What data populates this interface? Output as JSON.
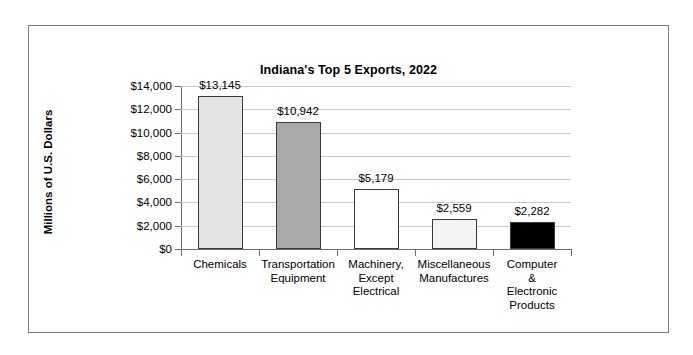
{
  "chart_data": {
    "type": "bar",
    "title": "Indiana's Top 5 Exports, 2022",
    "xlabel": "",
    "ylabel": "Millions of U.S. Dollars",
    "categories": [
      "Chemicals",
      "Transportation\nEquipment",
      "Machinery,\nExcept\nElectrical",
      "Miscellaneous\nManufactures",
      "Computer &\nElectronic\nProducts"
    ],
    "values": [
      13145,
      10942,
      5179,
      2559,
      2282
    ],
    "value_labels": [
      "$13,145",
      "$10,942",
      "$5,179",
      "$2,559",
      "$2,282"
    ],
    "bar_colors": [
      "#e4e4e4",
      "#a9a9a9",
      "#ffffff",
      "#f4f4f4",
      "#000000"
    ],
    "bar_edge_color": "#3a3a3a",
    "ylim": [
      0,
      14000
    ],
    "ytick_values": [
      0,
      2000,
      4000,
      6000,
      8000,
      10000,
      12000,
      14000
    ],
    "ytick_labels": [
      "$0",
      "$2,000",
      "$4,000",
      "$6,000",
      "$8,000",
      "$10,000",
      "$12,000",
      "$14,000"
    ],
    "grid": "horizontal",
    "gridline_color": "#c9c9c9",
    "axis_color": "#6e6e6e",
    "legend": "none",
    "border_color": "#7a7a7a",
    "background": "#ffffff"
  }
}
